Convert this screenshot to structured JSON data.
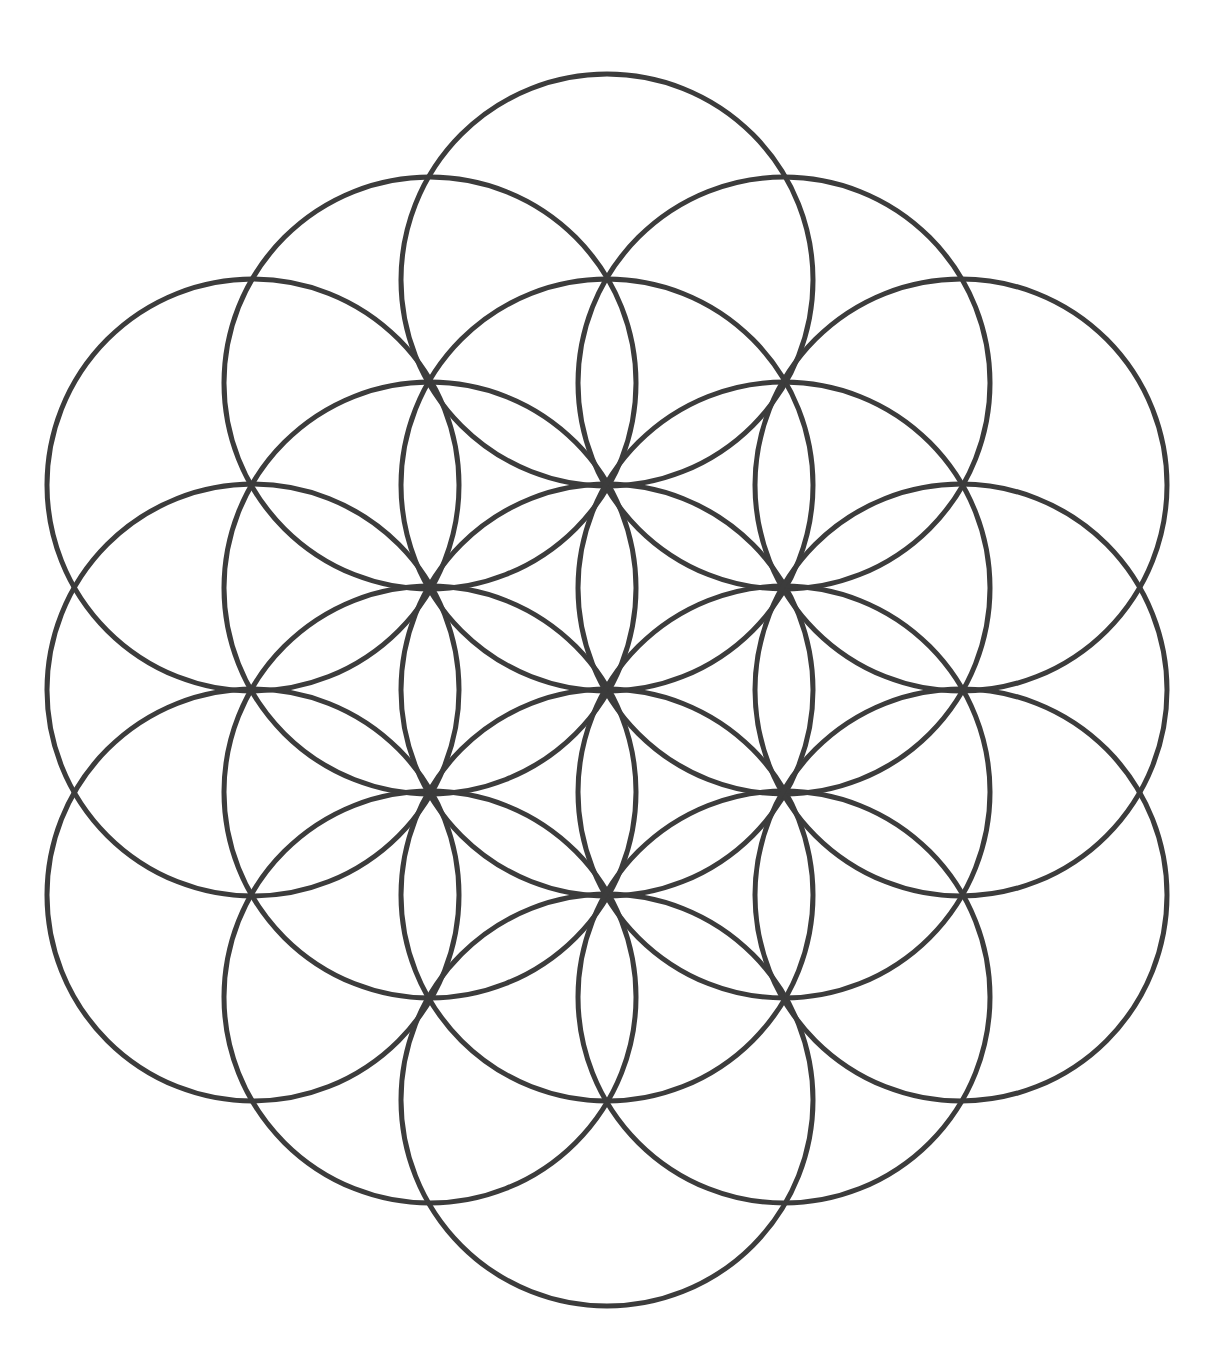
{
  "artwork": {
    "title": "Flower of Life",
    "description": "Overlapping-circles sacred geometry pattern, 19 circles on a triangular lattice, pointy-top hexagonal outline",
    "background_color": "#ffffff",
    "line_color": "#3c3c3c",
    "line_width": 5,
    "canvas": {
      "width": 1212,
      "height": 1354
    }
  },
  "chart_data": {
    "type": "scatter",
    "xlabel": "",
    "ylabel": "",
    "xlim": [
      0,
      1212
    ],
    "ylim": [
      0,
      1354
    ],
    "grid": false,
    "legend": "none",
    "geometry": {
      "shape": "circle",
      "radius": 206,
      "lattice_spacing": 206,
      "column_spacing": 178.4,
      "center_point": {
        "x": 607,
        "y": 690
      },
      "circle_count": 19,
      "columns": [
        {
          "x": 253,
          "count": 3
        },
        {
          "x": 430,
          "count": 4
        },
        {
          "x": 607,
          "count": 5
        },
        {
          "x": 784,
          "count": 4
        },
        {
          "x": 961,
          "count": 3
        }
      ]
    },
    "centers": [
      {
        "cx": 253,
        "cy": 485
      },
      {
        "cx": 253,
        "cy": 690
      },
      {
        "cx": 253,
        "cy": 895
      },
      {
        "cx": 430,
        "cy": 383
      },
      {
        "cx": 430,
        "cy": 588
      },
      {
        "cx": 430,
        "cy": 792
      },
      {
        "cx": 430,
        "cy": 997
      },
      {
        "cx": 607,
        "cy": 280
      },
      {
        "cx": 607,
        "cy": 485
      },
      {
        "cx": 607,
        "cy": 690
      },
      {
        "cx": 607,
        "cy": 895
      },
      {
        "cx": 607,
        "cy": 1100
      },
      {
        "cx": 784,
        "cy": 383
      },
      {
        "cx": 784,
        "cy": 588
      },
      {
        "cx": 784,
        "cy": 792
      },
      {
        "cx": 784,
        "cy": 997
      },
      {
        "cx": 961,
        "cy": 485
      },
      {
        "cx": 961,
        "cy": 690
      },
      {
        "cx": 961,
        "cy": 895
      }
    ],
    "radius": 206,
    "extents": {
      "top_y": 74,
      "bottom_y": 1306,
      "left_x": 47,
      "right_x": 1167
    }
  }
}
